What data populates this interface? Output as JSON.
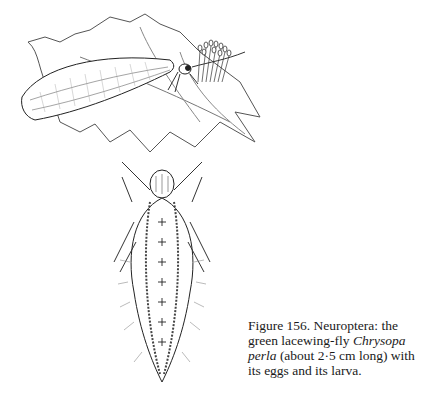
{
  "figure": {
    "illustrations": [
      {
        "name": "adult lacewing on leaves with eggs",
        "position": "top"
      },
      {
        "name": "lacewing larva",
        "position": "bottom-center"
      }
    ],
    "caption": {
      "prefix": "Figure 156. Neuroptera: the green lacewing-fly ",
      "species_italic": "Chrysopa perla",
      "suffix": " (about 2·5 cm long) with its eggs and its larva."
    }
  }
}
